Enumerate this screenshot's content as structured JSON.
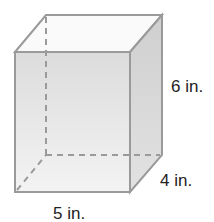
{
  "figure": {
    "type": "rectangular prism",
    "dimensions": {
      "height": "6 in.",
      "depth": "4 in.",
      "width": "5 in."
    }
  },
  "colors": {
    "edge": "#9a9a9a",
    "front_face": "#e6e6e6",
    "right_face": "#d4d4d4",
    "top_face": "#fafafa"
  }
}
